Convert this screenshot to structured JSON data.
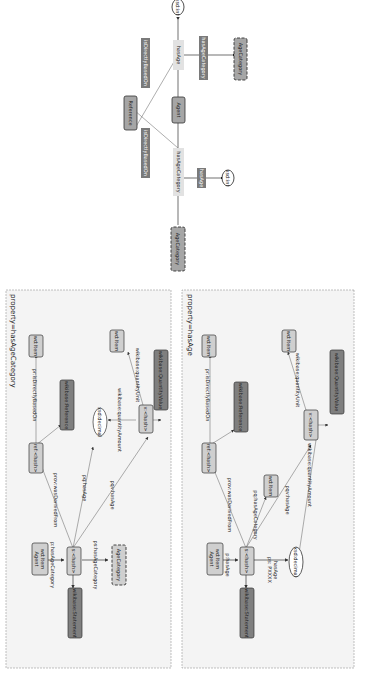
{
  "colors": {
    "node_light": "#cfcfcf",
    "node_dark": "#7f7f7f",
    "node_border": "#444444",
    "edge_label_bg_dark": "#7a7a7a",
    "edge_label_bg_light": "#e2e2e2",
    "panel_bg": "#f4f4f4",
    "panel_border": "#999999"
  },
  "schema": {
    "nodes": {
      "agent": "Agent",
      "reference": "Reference",
      "has_age_category": "hasAgeCategory",
      "has_age": "hasAge",
      "age_category_top": "AgeCategory",
      "age_category_right": "AgeCategory",
      "xsd_int_top": "xsd:int",
      "xsd_int_bottom": "xsd:int"
    },
    "edge_labels": {
      "is_directly_based_on_1": "isDirectlyBasedOn",
      "is_directly_based_on_2": "isDirectlyBasedOn",
      "has_age_category_label": "hasAgeCategory",
      "has_age_label": "hasAge"
    }
  },
  "panel_age_category": {
    "title": "property=hasAgeCategory",
    "nodes": {
      "wd_item_agent": [
        "wd:Item",
        "Agent"
      ],
      "s_hash": "s:<hash>",
      "statement": "wikibase:Statement",
      "age_category": "AgeCategory",
      "ref_hash": "ref:<hash>",
      "wikibase_reference": "wikibase:Reference",
      "wd_item_ref": "wd:Item",
      "xsd_decimal": "xsd:decimal",
      "v_hash": "v:<hash>",
      "wd_item_unit": "wd:Item",
      "quantity_value": "wikibase:QuantityValue"
    },
    "edges": {
      "p_has_age_category": "p:hasAgeCategory",
      "ps_has_age_category": "ps:hasAgeCategory",
      "prov_was_derived_from": "prov:wasDerivedFrom",
      "pq_has_age": "pq:hasAge",
      "pqv_has_age": "pqv:hasAge",
      "pr_is_directly_based_on": "pr:isDirectlyBasedOn",
      "quantity_amount": "wikibase:quantityAmount",
      "quantity_unit": "wikibase:quantityUnit"
    }
  },
  "panel_age": {
    "title": "property=hasAge",
    "nodes": {
      "wd_item_agent": [
        "wd:Item",
        "Agent"
      ],
      "s_hash": "s:<hash>",
      "statement": "wikibase:Statement",
      "xsd_decimal": "xsd:decimal",
      "ref_hash": "ref:<hash>",
      "wikibase_reference": "wikibase:Reference",
      "wd_item_ref": "wd:Item",
      "wd_item_cat": "wd:Item",
      "v_hash": "v:<hash>",
      "wd_item_unit": "wd:Item",
      "quantity_value": "wikibase:QuantityValue"
    },
    "edges": {
      "p_has_age": "p:hasAge",
      "ps_has_age": [
        "ps: PXXXX",
        "hasAge"
      ],
      "prov_was_derived_from": "prov:wasDerivedFrom",
      "pq_has_age_category": "pq:hasAgeCategory",
      "pqv_has_age": "pqv:hasAge",
      "pr_is_directly_based_on": "pr:isDirectlyBasedOn",
      "quantity_amount": "wikibase:quantityAmount",
      "quantity_unit": "wikibase:quantityUnit"
    }
  }
}
